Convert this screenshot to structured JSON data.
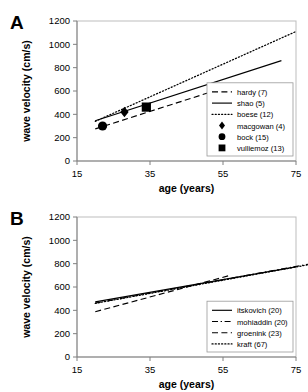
{
  "figure": {
    "panels": [
      {
        "letter": "A",
        "chart_ref": 0
      },
      {
        "letter": "B",
        "chart_ref": 1
      }
    ]
  },
  "chart_data": [
    {
      "type": "line",
      "panel": "A",
      "title": "",
      "xlabel": "age (years)",
      "ylabel": "wave velocity (cm/s)",
      "xlim": [
        15,
        75
      ],
      "ylim": [
        0,
        1200
      ],
      "xticks": [
        15,
        35,
        55,
        75
      ],
      "yticks": [
        0,
        200,
        400,
        600,
        800,
        1000,
        1200
      ],
      "grid": false,
      "legend_position": "lower-right",
      "series": [
        {
          "name": "hardy (7)",
          "style": "dashed",
          "kind": "line",
          "x": [
            20,
            57
          ],
          "y": [
            275,
            645
          ]
        },
        {
          "name": "shao (5)",
          "style": "solid",
          "kind": "line",
          "x": [
            20,
            71
          ],
          "y": [
            345,
            860
          ]
        },
        {
          "name": "boese (12)",
          "style": "dotted",
          "kind": "line",
          "x": [
            20,
            75
          ],
          "y": [
            340,
            1110
          ]
        },
        {
          "name": "macgowan (4)",
          "style": "none",
          "kind": "marker",
          "marker": "diamond",
          "x": [
            28
          ],
          "y": [
            420
          ]
        },
        {
          "name": "bock (15)",
          "style": "none",
          "kind": "marker",
          "marker": "circle",
          "x": [
            22
          ],
          "y": [
            300
          ]
        },
        {
          "name": "vulliemoz (13)",
          "style": "none",
          "kind": "marker",
          "marker": "square",
          "x": [
            34
          ],
          "y": [
            462
          ]
        }
      ]
    },
    {
      "type": "line",
      "panel": "B",
      "title": "",
      "xlabel": "age (years)",
      "ylabel": "wave velocity (cm/s)",
      "xlim": [
        15,
        75
      ],
      "ylim": [
        0,
        1200
      ],
      "xticks": [
        15,
        35,
        55,
        75
      ],
      "yticks": [
        0,
        200,
        400,
        600,
        800,
        1000,
        1200
      ],
      "grid": false,
      "legend_position": "lower-right",
      "series": [
        {
          "name": "itskovich (20)",
          "style": "solid",
          "kind": "line",
          "x": [
            20,
            75
          ],
          "y": [
            472,
            772
          ]
        },
        {
          "name": "mohiaddin (20)",
          "style": "dashdot",
          "kind": "line",
          "x": [
            20,
            80
          ],
          "y": [
            462,
            805
          ]
        },
        {
          "name": "groenink (23)",
          "style": "dashed",
          "kind": "line",
          "x": [
            20,
            57
          ],
          "y": [
            388,
            700
          ]
        },
        {
          "name": "kraft (67)",
          "style": "dotted",
          "kind": "line",
          "x": [
            20,
            80
          ],
          "y": [
            460,
            800
          ]
        }
      ]
    }
  ]
}
